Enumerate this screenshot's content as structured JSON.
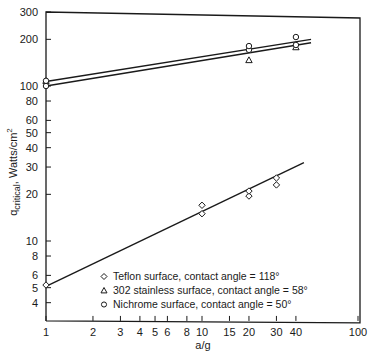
{
  "chart_data": {
    "type": "line",
    "title": "",
    "xlabel": "a/g",
    "ylabel": "q_critical, Watts/cm²",
    "ylabel_main": "q",
    "ylabel_sub": "critical",
    "ylabel_rest": ", Watts/cm",
    "ylabel_sup": "2",
    "xscale": "log",
    "yscale": "log",
    "xlim": [
      1,
      100
    ],
    "ylim": [
      3,
      300
    ],
    "x_ticks": [
      1,
      2,
      3,
      4,
      5,
      6,
      8,
      10,
      15,
      20,
      30,
      40,
      100
    ],
    "x_tick_labels": [
      "1",
      "2",
      "3",
      "4",
      "5",
      "6",
      "8",
      "10",
      "15",
      "20",
      "30",
      "40",
      "100"
    ],
    "y_ticks": [
      4,
      5,
      6,
      8,
      10,
      20,
      30,
      40,
      50,
      60,
      80,
      100,
      200,
      300
    ],
    "y_tick_labels": [
      "4",
      "5",
      "6",
      "8",
      "10",
      "20",
      "30",
      "40",
      "50",
      "60",
      "80",
      "100",
      "200",
      "300"
    ],
    "grid": false,
    "legend_position": "lower right (inside)",
    "series": [
      {
        "name": "Teflon surface, contact angle = 118°",
        "marker": "diamond",
        "points": [
          [
            1,
            5.2
          ],
          [
            10,
            15
          ],
          [
            10,
            17
          ],
          [
            20,
            19.5
          ],
          [
            20,
            21
          ],
          [
            30,
            23
          ],
          [
            30,
            25.5
          ]
        ],
        "fit_line": [
          [
            1,
            5.1
          ],
          [
            45,
            32
          ]
        ]
      },
      {
        "name": "302 stainless surface, contact angle = 58°",
        "marker": "triangle",
        "points": [
          [
            1,
            108
          ],
          [
            20,
            147
          ],
          [
            40,
            178
          ]
        ],
        "fit_line": [
          [
            1,
            100
          ],
          [
            50,
            190
          ]
        ]
      },
      {
        "name": "Nichrome surface, contact angle = 50°",
        "marker": "circle",
        "points": [
          [
            1,
            100
          ],
          [
            1,
            108
          ],
          [
            20,
            171
          ],
          [
            20,
            181
          ],
          [
            40,
            184
          ],
          [
            40,
            207
          ]
        ],
        "fit_line": [
          [
            1,
            107
          ],
          [
            50,
            200
          ]
        ]
      }
    ]
  }
}
